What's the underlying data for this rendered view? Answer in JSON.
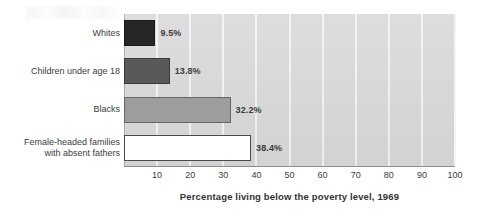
{
  "chart_data": {
    "type": "bar",
    "orientation": "horizontal",
    "title": "",
    "xlabel": "Percentage living below the poverty level, 1969",
    "ylabel": "",
    "xlim": [
      0,
      100
    ],
    "xticks": [
      10,
      20,
      30,
      40,
      50,
      60,
      70,
      80,
      90,
      100
    ],
    "xtick_labels": [
      "10",
      "20",
      "30",
      "40",
      "50",
      "60",
      "70",
      "80",
      "90",
      "100"
    ],
    "grid": "vertical-white",
    "legend": "none",
    "categories": [
      "Whites",
      "Children under age 18",
      "Blacks",
      "Female-headed families\nwith absent fathers"
    ],
    "values": [
      9.5,
      13.8,
      32.2,
      38.4
    ],
    "value_labels": [
      "9.5%",
      "13.8%",
      "32.2%",
      "38.4%"
    ],
    "bar_colors": [
      "#262626",
      "#595959",
      "#9d9d9d",
      "#ffffff"
    ],
    "plot_background": "#d9d9d9",
    "gridline_color": "#f4f4f4",
    "axis_color": "#8d8d8d",
    "text_color": "#3c3c3c"
  }
}
